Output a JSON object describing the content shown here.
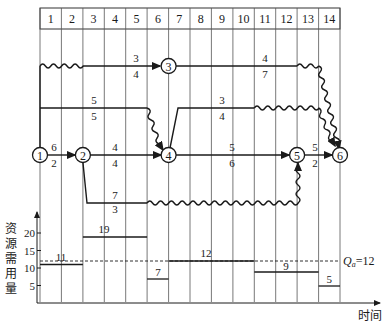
{
  "diagram": {
    "type": "time-scaled network diagram with resource histogram",
    "time_units": [
      "1",
      "2",
      "3",
      "4",
      "5",
      "6",
      "7",
      "8",
      "9",
      "10",
      "11",
      "12",
      "13",
      "14"
    ],
    "nodes": [
      {
        "id": "1",
        "label": "1",
        "time": 0
      },
      {
        "id": "2",
        "label": "2",
        "time": 2
      },
      {
        "id": "3",
        "label": "3",
        "time": 6
      },
      {
        "id": "4",
        "label": "4",
        "time": 6
      },
      {
        "id": "5",
        "label": "5",
        "time": 12
      },
      {
        "id": "6",
        "label": "6",
        "time": 14
      }
    ],
    "activities": [
      {
        "from": "1",
        "to": "2",
        "top": "6",
        "bottom": "2"
      },
      {
        "from": "1",
        "to": "3",
        "top": "3",
        "bottom": "4"
      },
      {
        "from": "1",
        "to": "4",
        "top": "5",
        "bottom": "5"
      },
      {
        "from": "2",
        "to": "4",
        "top": "4",
        "bottom": "4"
      },
      {
        "from": "2",
        "to": "5",
        "top": "7",
        "bottom": "3"
      },
      {
        "from": "3",
        "to": "6",
        "top": "4",
        "bottom": "7"
      },
      {
        "from": "4",
        "to": "6",
        "top": "3",
        "bottom": "4"
      },
      {
        "from": "4",
        "to": "5",
        "top": "5",
        "bottom": "6"
      },
      {
        "from": "5",
        "to": "6",
        "top": "5",
        "bottom": "2"
      }
    ]
  },
  "histogram": {
    "ylabel": "资源需用量",
    "xlabel": "时间",
    "yticks": [
      "5",
      "10",
      "15",
      "20"
    ],
    "limit_label": "Q",
    "limit_sub": "a",
    "limit_value": "=12",
    "bars": [
      {
        "from": 0,
        "to": 2,
        "value": 11,
        "label": "11"
      },
      {
        "from": 2,
        "to": 5,
        "value": 19,
        "label": "19"
      },
      {
        "from": 5,
        "to": 6,
        "value": 7,
        "label": "7"
      },
      {
        "from": 6,
        "to": 10,
        "value": 12,
        "label": "12"
      },
      {
        "from": 10,
        "to": 13,
        "value": 9,
        "label": "9"
      },
      {
        "from": 13,
        "to": 14,
        "value": 5,
        "label": "5"
      }
    ]
  }
}
